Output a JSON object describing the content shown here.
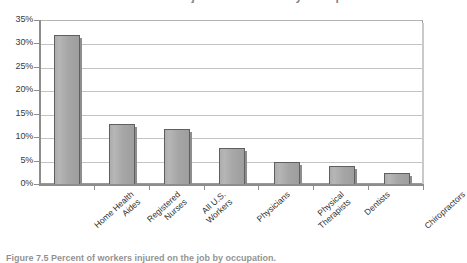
{
  "chart_data": {
    "type": "bar",
    "title": "Percent of Workers Injured on the Job by Occupation",
    "xlabel": "",
    "ylabel": "",
    "ylim": [
      0,
      35
    ],
    "ytick_step": 5,
    "grid": true,
    "legend": "none",
    "bar_color": "#a8a8a8",
    "bar_border_color": "#5f5f5f",
    "categories": [
      "Home Health Aides",
      "Registered Nurses",
      "All U.S. Workers",
      "Physicians",
      "Physical Therapists",
      "Dentists",
      "Chiropractors"
    ],
    "values": [
      32,
      13,
      12,
      8,
      5,
      4,
      2.5
    ],
    "tick_labels": [
      "0%",
      "5%",
      "10%",
      "15%",
      "20%",
      "25%",
      "30%",
      "35%"
    ],
    "category_lines": [
      [
        "Home Health",
        "Aides"
      ],
      [
        "Registered",
        "Nurses"
      ],
      [
        "All U.S.",
        "Workers"
      ],
      [
        "Physicians"
      ],
      [
        "Physical",
        "Therapists"
      ],
      [
        "Dentists"
      ],
      [
        "Chiropractors"
      ]
    ]
  },
  "caption": "Figure 7.5  Percent of workers injured on the job by occupation."
}
